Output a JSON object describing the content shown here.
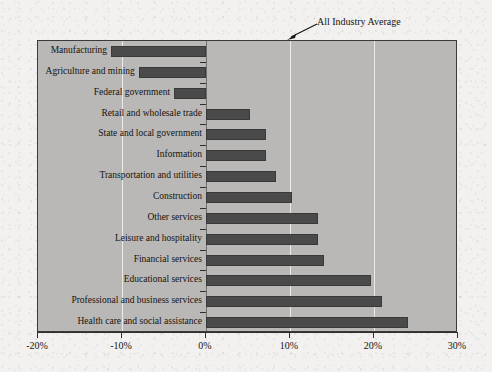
{
  "chart_data": {
    "type": "bar",
    "orientation": "horizontal",
    "title": "",
    "subtitle": "",
    "xlabel": "",
    "ylabel": "",
    "xlim": [
      -20,
      30
    ],
    "ylim": null,
    "grid": true,
    "gridlines_x": [
      -10,
      10,
      20
    ],
    "zero_line": 0,
    "legend": null,
    "legend_position": "none",
    "x_tick_labels": [
      "-20%",
      "-10%",
      "0%",
      "10%",
      "20%",
      "30%"
    ],
    "x_ticks": [
      -20,
      -10,
      0,
      10,
      20,
      30
    ],
    "categories": [
      "Manufacturing",
      "Agriculture and mining",
      "Federal government",
      "Retail and wholesale trade",
      "State and local government",
      "Information",
      "Transportation and utilities",
      "Construction",
      "Other services",
      "Leisure and hospitality",
      "Financial services",
      "Educational services",
      "Professional and business services",
      "Health care and social assistance"
    ],
    "values": [
      -11.3,
      -8.0,
      -3.8,
      5.2,
      7.1,
      7.1,
      8.3,
      10.2,
      13.3,
      13.3,
      14.0,
      19.6,
      21.0,
      24.0
    ],
    "value_unit": "%",
    "annotations": [
      {
        "text": "All Industry Average",
        "points_to_x": 10,
        "points_to_y": "top-of-plot",
        "type": "arrow-label"
      }
    ],
    "colors": {
      "bar_fill": "#4b4a4a",
      "bar_edge": "#3a3939",
      "plot_background": "#b9b8b6",
      "page_background": "#f2f1ef",
      "gridline": "#eceae6",
      "axis": "#2e2d2c",
      "text": "#15130f"
    }
  }
}
